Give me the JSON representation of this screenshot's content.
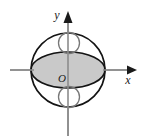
{
  "figure": {
    "background_color": "#ffffff",
    "width": 143,
    "height": 139,
    "axes": {
      "origin_label": "O",
      "origin_x": 68,
      "origin_y": 70,
      "x_axis": {
        "label": "x",
        "label_x": 127,
        "label_y": 83,
        "line_x1": 10,
        "line_y1": 70,
        "line_x2": 128,
        "line_y2": 70,
        "arrow_points": "127,65.5 136,70 127,74.5",
        "color": "#8c8c8c"
      },
      "y_axis": {
        "label": "y",
        "label_x": 58,
        "label_y": 18,
        "line_x1": 68,
        "line_y1": 22,
        "line_x2": 68,
        "line_y2": 136,
        "arrow_points": "63.5,22 68,12 72.5,22",
        "color": "#8c8c8c"
      },
      "origin_label_x": 63,
      "origin_label_y": 81
    },
    "shapes": {
      "big_circle": {
        "name": "outer circle",
        "cx": 68,
        "cy": 70,
        "r": 37,
        "fill": "#ffffff",
        "stroke": "#141414"
      },
      "shaded_ellipse": {
        "name": "shaded ellipse cross-section",
        "cx": 68,
        "cy": 70,
        "rx": 37,
        "ry": 18,
        "fill": "#c9c9c9",
        "stroke": "#141414"
      },
      "upper_small_circle": {
        "name": "upper small circle",
        "cx": 69,
        "cy": 43,
        "r": 10.5,
        "fill": "none",
        "stroke": "#777777"
      },
      "lower_small_circle": {
        "name": "lower small circle",
        "cx": 69,
        "cy": 97,
        "r": 10.5,
        "fill": "none",
        "stroke": "#777777"
      }
    }
  }
}
